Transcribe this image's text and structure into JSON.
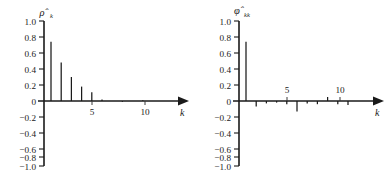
{
  "figure": {
    "background": "#ffffff",
    "axis_color": "#1a1a1a",
    "panels": [
      {
        "name": "acf",
        "y_axis_title": "ρ̂",
        "y_axis_subscript": "k",
        "x_axis_title": "k",
        "y_tick_labels": [
          "1.0",
          "0.8",
          "0.6",
          "0.4",
          "0.2",
          "0",
          "−0.2",
          "−0.4",
          "−0.6",
          "−0.8",
          "−1.0"
        ],
        "y_tick_values": [
          1.0,
          0.8,
          0.6,
          0.4,
          0.2,
          0,
          -0.2,
          -0.4,
          -0.6,
          -0.8,
          -1.0
        ],
        "x_tick_labels": [
          "5",
          "10"
        ],
        "x_tick_values": [
          5,
          10
        ]
      },
      {
        "name": "pacf",
        "y_axis_title": "φ̂",
        "y_axis_subscript": "kk",
        "x_axis_title": "k",
        "y_tick_labels": [
          "1.0",
          "0.8",
          "0.6",
          "0.4",
          "0.2",
          "0",
          "−0.2",
          "−0.4",
          "−0.6",
          "−0.8",
          "−1.0"
        ],
        "y_tick_values": [
          1.0,
          0.8,
          0.6,
          0.4,
          0.2,
          0,
          -0.2,
          -0.4,
          -0.6,
          -0.8,
          -1.0
        ],
        "x_tick_labels": [
          "5",
          "10"
        ],
        "x_tick_values": [
          5,
          10
        ]
      }
    ]
  },
  "chart_data": [
    {
      "type": "bar",
      "name": "sample-autocorrelation-function",
      "title": "",
      "xlabel": "k",
      "ylabel": "ρ̂k",
      "ylim": [
        -1.0,
        1.0
      ],
      "xlim": [
        0,
        13
      ],
      "grid": false,
      "legend": "none",
      "categories": [
        1,
        2,
        3,
        4,
        5,
        6,
        7,
        8,
        9,
        10,
        11,
        12
      ],
      "values": [
        0.74,
        0.48,
        0.3,
        0.18,
        0.11,
        0.02,
        0.0,
        -0.01,
        0.0,
        0.01,
        0.0,
        0.0
      ]
    },
    {
      "type": "bar",
      "name": "sample-partial-autocorrelation-function",
      "title": "",
      "xlabel": "k",
      "ylabel": "φ̂kk",
      "ylim": [
        -1.0,
        1.0
      ],
      "xlim": [
        0,
        13
      ],
      "grid": false,
      "legend": "none",
      "categories": [
        1,
        2,
        3,
        4,
        5,
        6,
        7,
        8,
        9,
        10,
        11,
        12
      ],
      "values": [
        0.74,
        -0.07,
        -0.03,
        -0.02,
        -0.04,
        -0.13,
        -0.03,
        -0.04,
        0.05,
        -0.04,
        -0.05,
        0.0
      ]
    }
  ]
}
